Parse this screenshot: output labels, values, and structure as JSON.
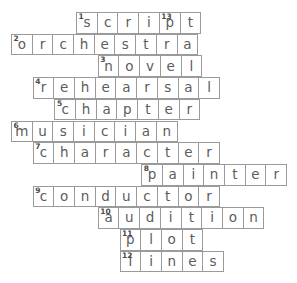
{
  "puzzle": {
    "title": "Crossword Puzzle",
    "cell_size": 21.7,
    "origin_x": 11,
    "origin_y": 12,
    "border_color": "#9a9a9a",
    "letter_color": "#5c5c5c",
    "number_color": "#4a4a4a",
    "background": "#ffffff",
    "rows": [
      {
        "index": 0,
        "col": 3,
        "word": "script",
        "cells": [
          {
            "letter": "s",
            "number": "1"
          },
          {
            "letter": "c",
            "number": ""
          },
          {
            "letter": "r",
            "number": ""
          },
          {
            "letter": "i",
            "number": ""
          },
          {
            "letter": "p",
            "number": "13"
          },
          {
            "letter": "t",
            "number": ""
          }
        ]
      },
      {
        "index": 1,
        "col": 0,
        "word": "orchestra",
        "cells": [
          {
            "letter": "o",
            "number": "2"
          },
          {
            "letter": "r",
            "number": ""
          },
          {
            "letter": "c",
            "number": ""
          },
          {
            "letter": "h",
            "number": ""
          },
          {
            "letter": "e",
            "number": ""
          },
          {
            "letter": "s",
            "number": ""
          },
          {
            "letter": "t",
            "number": ""
          },
          {
            "letter": "r",
            "number": ""
          },
          {
            "letter": "a",
            "number": ""
          }
        ]
      },
      {
        "index": 2,
        "col": 4,
        "word": "novel",
        "cells": [
          {
            "letter": "n",
            "number": "3"
          },
          {
            "letter": "o",
            "number": ""
          },
          {
            "letter": "v",
            "number": ""
          },
          {
            "letter": "e",
            "number": ""
          },
          {
            "letter": "l",
            "number": ""
          }
        ]
      },
      {
        "index": 3,
        "col": 1,
        "word": "rehearsal",
        "cells": [
          {
            "letter": "r",
            "number": "4"
          },
          {
            "letter": "e",
            "number": ""
          },
          {
            "letter": "h",
            "number": ""
          },
          {
            "letter": "e",
            "number": ""
          },
          {
            "letter": "a",
            "number": ""
          },
          {
            "letter": "r",
            "number": ""
          },
          {
            "letter": "s",
            "number": ""
          },
          {
            "letter": "a",
            "number": ""
          },
          {
            "letter": "l",
            "number": ""
          }
        ]
      },
      {
        "index": 4,
        "col": 2,
        "word": "chapter",
        "cells": [
          {
            "letter": "c",
            "number": "5"
          },
          {
            "letter": "h",
            "number": ""
          },
          {
            "letter": "a",
            "number": ""
          },
          {
            "letter": "p",
            "number": ""
          },
          {
            "letter": "t",
            "number": ""
          },
          {
            "letter": "e",
            "number": ""
          },
          {
            "letter": "r",
            "number": ""
          }
        ]
      },
      {
        "index": 5,
        "col": 0,
        "word": "musician",
        "cells": [
          {
            "letter": "m",
            "number": "6"
          },
          {
            "letter": "u",
            "number": ""
          },
          {
            "letter": "s",
            "number": ""
          },
          {
            "letter": "i",
            "number": ""
          },
          {
            "letter": "c",
            "number": ""
          },
          {
            "letter": "i",
            "number": ""
          },
          {
            "letter": "a",
            "number": ""
          },
          {
            "letter": "n",
            "number": ""
          }
        ]
      },
      {
        "index": 6,
        "col": 1,
        "word": "character",
        "cells": [
          {
            "letter": "c",
            "number": "7"
          },
          {
            "letter": "h",
            "number": ""
          },
          {
            "letter": "a",
            "number": ""
          },
          {
            "letter": "r",
            "number": ""
          },
          {
            "letter": "a",
            "number": ""
          },
          {
            "letter": "c",
            "number": ""
          },
          {
            "letter": "t",
            "number": ""
          },
          {
            "letter": "e",
            "number": ""
          },
          {
            "letter": "r",
            "number": ""
          }
        ]
      },
      {
        "index": 7,
        "col": 6,
        "word": "painter",
        "cells": [
          {
            "letter": "p",
            "number": "8"
          },
          {
            "letter": "a",
            "number": ""
          },
          {
            "letter": "i",
            "number": ""
          },
          {
            "letter": "n",
            "number": ""
          },
          {
            "letter": "t",
            "number": ""
          },
          {
            "letter": "e",
            "number": ""
          },
          {
            "letter": "r",
            "number": ""
          }
        ]
      },
      {
        "index": 8,
        "col": 1,
        "word": "conductor",
        "cells": [
          {
            "letter": "c",
            "number": "9"
          },
          {
            "letter": "o",
            "number": ""
          },
          {
            "letter": "n",
            "number": ""
          },
          {
            "letter": "d",
            "number": ""
          },
          {
            "letter": "u",
            "number": ""
          },
          {
            "letter": "c",
            "number": ""
          },
          {
            "letter": "t",
            "number": ""
          },
          {
            "letter": "o",
            "number": ""
          },
          {
            "letter": "r",
            "number": ""
          }
        ]
      },
      {
        "index": 9,
        "col": 4,
        "word": "audition",
        "cells": [
          {
            "letter": "a",
            "number": "10"
          },
          {
            "letter": "u",
            "number": ""
          },
          {
            "letter": "d",
            "number": ""
          },
          {
            "letter": "i",
            "number": ""
          },
          {
            "letter": "t",
            "number": ""
          },
          {
            "letter": "i",
            "number": ""
          },
          {
            "letter": "o",
            "number": ""
          },
          {
            "letter": "n",
            "number": ""
          }
        ]
      },
      {
        "index": 10,
        "col": 5,
        "word": "plot",
        "cells": [
          {
            "letter": "p",
            "number": "11"
          },
          {
            "letter": "l",
            "number": ""
          },
          {
            "letter": "o",
            "number": ""
          },
          {
            "letter": "t",
            "number": ""
          }
        ]
      },
      {
        "index": 11,
        "col": 5,
        "word": "lines",
        "cells": [
          {
            "letter": "l",
            "number": "12"
          },
          {
            "letter": "i",
            "number": ""
          },
          {
            "letter": "n",
            "number": ""
          },
          {
            "letter": "e",
            "number": ""
          },
          {
            "letter": "s",
            "number": ""
          }
        ]
      }
    ]
  }
}
